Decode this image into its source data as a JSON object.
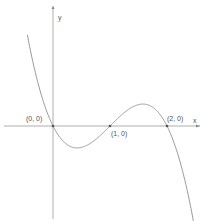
{
  "chart_data": {
    "type": "line",
    "title": "",
    "function": "y = -x(x-1)(x-2)",
    "xlabel": "x",
    "ylabel": "y",
    "annotations": [
      {
        "label": "(0, 0)",
        "x": 0,
        "y": 0
      },
      {
        "label": "(1, 0)",
        "x": 1,
        "y": 0
      },
      {
        "label": "(2, 0)",
        "x": 2,
        "y": 0
      }
    ],
    "series": [
      {
        "name": "curve",
        "x": [
          -0.45,
          -0.25,
          0,
          0.25,
          0.42,
          0.75,
          1,
          1.25,
          1.58,
          1.75,
          2,
          2.25,
          2.5
        ],
        "values": [
          0.95,
          0.36,
          0,
          -0.33,
          -0.38,
          -0.23,
          0,
          0.23,
          0.38,
          0.33,
          0,
          -0.7,
          -1.88
        ]
      }
    ],
    "xlim": [
      -0.93,
      2.65
    ],
    "ylim": [
      -1.67,
      2.21
    ],
    "grid": false,
    "color": "#888888"
  },
  "axes": {
    "x_label": "x",
    "y_label": "y"
  },
  "points": [
    {
      "label": "(0, 0)"
    },
    {
      "label": "(1, 0)"
    },
    {
      "label": "(2, 0)"
    }
  ]
}
